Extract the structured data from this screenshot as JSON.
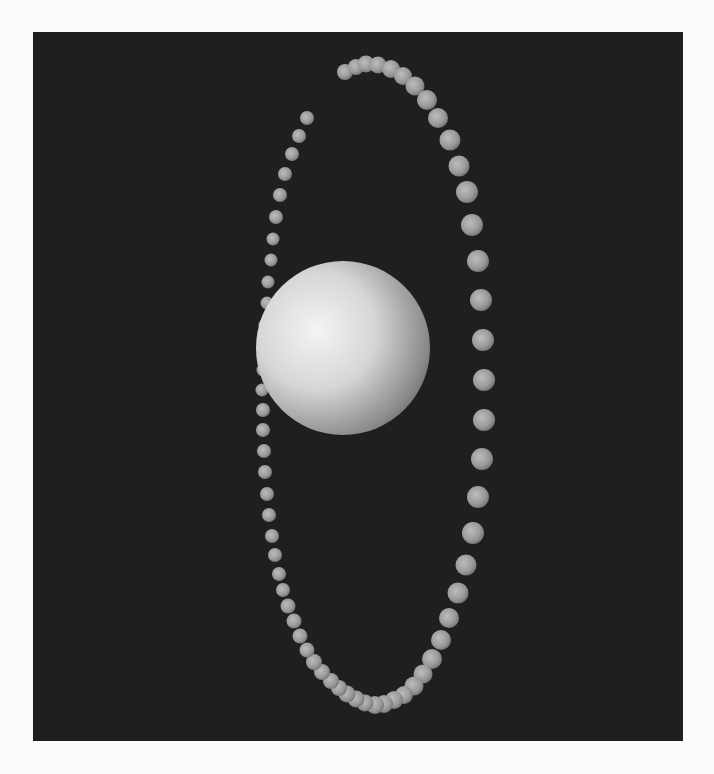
{
  "scene": {
    "background": "#fbfbfb",
    "panel": {
      "x": 33,
      "y": 32,
      "width": 650,
      "height": 709,
      "color": "#1f1f1f"
    },
    "main_sphere": {
      "cx": 343,
      "cy": 348,
      "r": 87,
      "highlight": "#f2f2f2",
      "mid": "#c8c8c8",
      "shadow": "#6e6e6e"
    },
    "ring_color": {
      "light": "#b9b9b9",
      "mid": "#959595",
      "dark": "#6a6a6a"
    },
    "ring_back": [
      [
        307,
        118,
        7
      ],
      [
        299,
        136,
        7
      ],
      [
        292,
        154,
        7
      ],
      [
        285,
        174,
        7
      ],
      [
        280,
        195,
        7
      ],
      [
        276,
        217,
        7
      ],
      [
        273,
        239,
        6.5
      ],
      [
        271,
        260,
        6.5
      ],
      [
        268,
        282,
        6.5
      ],
      [
        267,
        303,
        6.5
      ],
      [
        265,
        325,
        6.5
      ],
      [
        264,
        345,
        6.5
      ],
      [
        263,
        370,
        6.5
      ],
      [
        262,
        390,
        6.5
      ],
      [
        263,
        410,
        7
      ],
      [
        263,
        430,
        7
      ]
    ],
    "ring_front": [
      [
        345,
        72,
        8
      ],
      [
        356,
        67,
        8
      ],
      [
        366,
        64,
        8.5
      ],
      [
        378,
        65,
        8.5
      ],
      [
        391,
        69,
        9
      ],
      [
        403,
        76,
        9
      ],
      [
        415,
        86,
        9.5
      ],
      [
        427,
        100,
        10
      ],
      [
        438,
        118,
        10
      ],
      [
        450,
        140,
        10.5
      ],
      [
        459,
        166,
        10.5
      ],
      [
        467,
        192,
        11
      ],
      [
        472,
        225,
        11
      ],
      [
        478,
        261,
        11
      ],
      [
        481,
        300,
        11
      ],
      [
        483,
        340,
        11
      ],
      [
        484,
        380,
        11
      ],
      [
        484,
        420,
        11
      ],
      [
        482,
        459,
        11
      ],
      [
        478,
        497,
        11
      ],
      [
        473,
        533,
        11
      ],
      [
        466,
        565,
        10.5
      ],
      [
        458,
        593,
        10.5
      ],
      [
        449,
        618,
        10
      ],
      [
        441,
        640,
        10
      ],
      [
        432,
        659,
        10
      ],
      [
        423,
        674,
        9.5
      ],
      [
        414,
        686,
        9.5
      ],
      [
        404,
        695,
        9
      ],
      [
        394,
        700,
        9
      ],
      [
        384,
        704,
        9
      ],
      [
        375,
        705,
        9
      ],
      [
        365,
        703,
        8.5
      ],
      [
        356,
        699,
        8.5
      ],
      [
        347,
        694,
        8.5
      ],
      [
        339,
        688,
        8
      ],
      [
        331,
        681,
        8
      ],
      [
        322,
        672,
        8
      ],
      [
        314,
        662,
        8
      ],
      [
        307,
        650,
        7.5
      ],
      [
        300,
        636,
        7.5
      ],
      [
        294,
        621,
        7.5
      ],
      [
        288,
        606,
        7.5
      ],
      [
        283,
        590,
        7
      ],
      [
        279,
        574,
        7
      ],
      [
        275,
        555,
        7
      ],
      [
        272,
        536,
        7
      ],
      [
        269,
        515,
        7
      ],
      [
        267,
        494,
        7
      ],
      [
        265,
        472,
        7
      ],
      [
        264,
        451,
        7
      ]
    ]
  }
}
